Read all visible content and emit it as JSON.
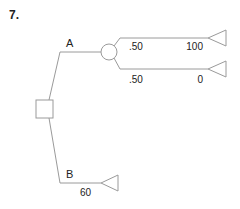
{
  "problem_number": "7.",
  "tree": {
    "decision_node": {
      "type": "square"
    },
    "branches": [
      {
        "label": "A",
        "chance_node": {
          "type": "circle"
        },
        "outcomes": [
          {
            "probability": ".50",
            "payoff": "100"
          },
          {
            "probability": ".50",
            "payoff": "0"
          }
        ]
      },
      {
        "label": "B",
        "payoff": "60"
      }
    ]
  },
  "colors": {
    "line": "#9a9a9a",
    "text": "#222222"
  }
}
